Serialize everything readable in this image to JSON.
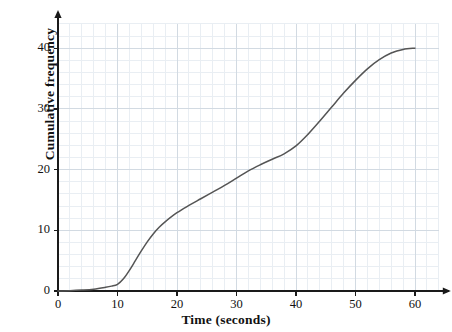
{
  "figure": {
    "background_color": "#ffffff",
    "grid_minor_color": "#e9eef3",
    "grid_major_color": "#d2dae2",
    "axis_color": "#1a1a1a",
    "curve_color": "#555555"
  },
  "chart_data": {
    "type": "line",
    "title": "",
    "subtitle": "",
    "xlabel": "Time (seconds)",
    "ylabel": "Cumulative frequency",
    "xlim": [
      0,
      64
    ],
    "ylim": [
      0,
      44
    ],
    "xticks": [
      0,
      10,
      20,
      30,
      40,
      50,
      60
    ],
    "xtick_labels": [
      "0",
      "10",
      "20",
      "30",
      "40",
      "50",
      "60"
    ],
    "yticks": [
      0,
      10,
      20,
      30,
      40
    ],
    "ytick_labels": [
      "0",
      "10",
      "20",
      "30",
      "40"
    ],
    "grid": true,
    "grid_major_step_x": 10,
    "grid_major_step_y": 10,
    "grid_minor_step_x": 2,
    "grid_minor_step_y": 2,
    "legend": false,
    "legend_position": "none",
    "annotations": [],
    "series": [
      {
        "name": "Cumulative frequency",
        "color": "#555555",
        "x": [
          0,
          2,
          4,
          6,
          8,
          9,
          10,
          11,
          12,
          13,
          14,
          15,
          16,
          17,
          18,
          20,
          22,
          24,
          26,
          28,
          30,
          32,
          34,
          36,
          38,
          40,
          42,
          44,
          46,
          48,
          50,
          52,
          54,
          56,
          58,
          60
        ],
        "y": [
          0,
          0.05,
          0.15,
          0.3,
          0.6,
          0.8,
          1.1,
          2.0,
          3.4,
          5.0,
          6.6,
          8.1,
          9.4,
          10.5,
          11.4,
          12.9,
          14.1,
          15.2,
          16.3,
          17.4,
          18.6,
          19.8,
          20.8,
          21.7,
          22.6,
          23.9,
          25.8,
          28.0,
          30.3,
          32.6,
          34.7,
          36.6,
          38.1,
          39.2,
          39.8,
          40.0
        ]
      }
    ]
  }
}
